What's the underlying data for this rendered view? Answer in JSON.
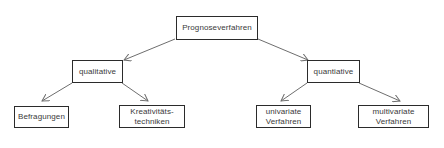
{
  "diagram": {
    "type": "tree",
    "title": "Prognoseverfahren",
    "colors": {
      "border": "#2b2b2b",
      "text": "#3a3a3a",
      "edge": "#6e6e6e",
      "background": "#ffffff"
    },
    "nodes": {
      "root": {
        "label": "Prognoseverfahren"
      },
      "qualitative": {
        "label": "qualitative"
      },
      "quantitative": {
        "label": "quantiative"
      },
      "befragungen": {
        "label": "Befragungen"
      },
      "kreativitaetstechniken": {
        "label": "Kreativitäts-\ntechniken"
      },
      "univariate": {
        "label": "univariate\nVerfahren"
      },
      "multivariate": {
        "label": "multivariate\nVerfahren"
      }
    },
    "edges": [
      {
        "from": "root",
        "to": "qualitative"
      },
      {
        "from": "root",
        "to": "quantitative"
      },
      {
        "from": "qualitative",
        "to": "befragungen"
      },
      {
        "from": "qualitative",
        "to": "kreativitaetstechniken"
      },
      {
        "from": "quantitative",
        "to": "univariate"
      },
      {
        "from": "quantitative",
        "to": "multivariate"
      }
    ]
  }
}
